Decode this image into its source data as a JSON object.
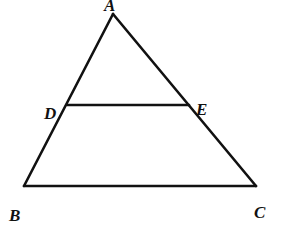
{
  "diagram": {
    "type": "geometry-triangle-with-midsegment",
    "colors": {
      "stroke": "#111111",
      "background": "#ffffff"
    },
    "points": {
      "A": {
        "label": "A",
        "x": 113,
        "y": 14
      },
      "B": {
        "label": "B",
        "x": 24,
        "y": 186
      },
      "C": {
        "label": "C",
        "x": 256,
        "y": 186
      },
      "D": {
        "label": "D",
        "x": 67,
        "y": 105
      },
      "E": {
        "label": "E",
        "x": 189,
        "y": 105
      }
    },
    "segments": [
      {
        "name": "AB",
        "from": "A",
        "to": "B"
      },
      {
        "name": "AC",
        "from": "A",
        "to": "C"
      },
      {
        "name": "BC",
        "from": "B",
        "to": "C"
      },
      {
        "name": "DE",
        "from": "D",
        "to": "E"
      }
    ],
    "labels": {
      "A": {
        "text": "A",
        "x": 104,
        "y": 11
      },
      "B": {
        "text": "B",
        "x": 9,
        "y": 221
      },
      "C": {
        "text": "C",
        "x": 254,
        "y": 218
      },
      "D": {
        "text": "D",
        "x": 44,
        "y": 119
      },
      "E": {
        "text": "E",
        "x": 196,
        "y": 115
      }
    }
  }
}
